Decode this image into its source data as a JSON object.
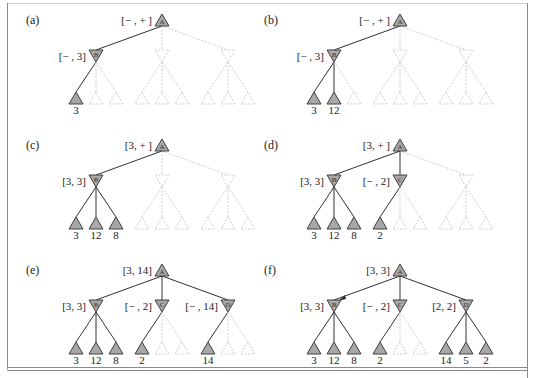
{
  "figure": {
    "colors": {
      "node_fill": "#a8a8a8",
      "node_stroke": "#404040",
      "edge_active": "#303030",
      "edge_pruned": "#c8c8c8",
      "text": "#222222"
    },
    "panels": [
      {
        "label": "(a)",
        "root": {
          "letter": "A",
          "interval": "[− , + ]"
        },
        "mins": [
          {
            "letter": "B",
            "interval": "[− , 3]",
            "active": true,
            "leaves": [
              {
                "value": "3",
                "active": true
              },
              {
                "value": "",
                "active": false
              },
              {
                "value": "",
                "active": false
              }
            ]
          },
          {
            "letter": "",
            "interval": "",
            "active": false,
            "leaves": [
              {
                "value": "",
                "active": false
              },
              {
                "value": "",
                "active": false
              },
              {
                "value": "",
                "active": false
              }
            ]
          },
          {
            "letter": "",
            "interval": "",
            "active": false,
            "leaves": [
              {
                "value": "",
                "active": false
              },
              {
                "value": "",
                "active": false
              },
              {
                "value": "",
                "active": false
              }
            ]
          }
        ]
      },
      {
        "label": "(b)",
        "root": {
          "letter": "A",
          "interval": "[− , + ]"
        },
        "mins": [
          {
            "letter": "B",
            "interval": "[− , 3]",
            "active": true,
            "leaves": [
              {
                "value": "3",
                "active": true
              },
              {
                "value": "12",
                "active": true
              },
              {
                "value": "",
                "active": false
              }
            ]
          },
          {
            "letter": "",
            "interval": "",
            "active": false,
            "leaves": [
              {
                "value": "",
                "active": false
              },
              {
                "value": "",
                "active": false
              },
              {
                "value": "",
                "active": false
              }
            ]
          },
          {
            "letter": "",
            "interval": "",
            "active": false,
            "leaves": [
              {
                "value": "",
                "active": false
              },
              {
                "value": "",
                "active": false
              },
              {
                "value": "",
                "active": false
              }
            ]
          }
        ]
      },
      {
        "label": "(c)",
        "root": {
          "letter": "A",
          "interval": "[3, + ]"
        },
        "mins": [
          {
            "letter": "B",
            "interval": "[3, 3]",
            "active": true,
            "leaves": [
              {
                "value": "3",
                "active": true
              },
              {
                "value": "12",
                "active": true
              },
              {
                "value": "8",
                "active": true
              }
            ]
          },
          {
            "letter": "",
            "interval": "",
            "active": false,
            "leaves": [
              {
                "value": "",
                "active": false
              },
              {
                "value": "",
                "active": false
              },
              {
                "value": "",
                "active": false
              }
            ]
          },
          {
            "letter": "",
            "interval": "",
            "active": false,
            "leaves": [
              {
                "value": "",
                "active": false
              },
              {
                "value": "",
                "active": false
              },
              {
                "value": "",
                "active": false
              }
            ]
          }
        ]
      },
      {
        "label": "(d)",
        "root": {
          "letter": "A",
          "interval": "[3, + ]"
        },
        "mins": [
          {
            "letter": "B",
            "interval": "[3, 3]",
            "active": true,
            "leaves": [
              {
                "value": "3",
                "active": true
              },
              {
                "value": "12",
                "active": true
              },
              {
                "value": "8",
                "active": true
              }
            ]
          },
          {
            "letter": "C",
            "interval": "[− , 2]",
            "active": true,
            "leaves": [
              {
                "value": "2",
                "active": true
              },
              {
                "value": "",
                "active": false
              },
              {
                "value": "",
                "active": false
              }
            ]
          },
          {
            "letter": "",
            "interval": "",
            "active": false,
            "leaves": [
              {
                "value": "",
                "active": false
              },
              {
                "value": "",
                "active": false
              },
              {
                "value": "",
                "active": false
              }
            ]
          }
        ]
      },
      {
        "label": "(e)",
        "root": {
          "letter": "A",
          "interval": "[3, 14]"
        },
        "mins": [
          {
            "letter": "B",
            "interval": "[3, 3]",
            "active": true,
            "leaves": [
              {
                "value": "3",
                "active": true
              },
              {
                "value": "12",
                "active": true
              },
              {
                "value": "8",
                "active": true
              }
            ]
          },
          {
            "letter": "C",
            "interval": "[− , 2]",
            "active": true,
            "leaves": [
              {
                "value": "2",
                "active": true
              },
              {
                "value": "",
                "active": false
              },
              {
                "value": "",
                "active": false
              }
            ]
          },
          {
            "letter": "D",
            "interval": "[− , 14]",
            "active": true,
            "leaves": [
              {
                "value": "14",
                "active": true
              },
              {
                "value": "",
                "active": false
              },
              {
                "value": "",
                "active": false
              }
            ]
          }
        ]
      },
      {
        "label": "(f)",
        "root": {
          "letter": "A",
          "interval": "[3, 3]"
        },
        "best_move_arrow_to": 0,
        "mins": [
          {
            "letter": "B",
            "interval": "[3, 3]",
            "active": true,
            "leaves": [
              {
                "value": "3",
                "active": true
              },
              {
                "value": "12",
                "active": true
              },
              {
                "value": "8",
                "active": true
              }
            ]
          },
          {
            "letter": "C",
            "interval": "[− , 2]",
            "active": true,
            "leaves": [
              {
                "value": "2",
                "active": true
              },
              {
                "value": "",
                "active": false
              },
              {
                "value": "",
                "active": false
              }
            ]
          },
          {
            "letter": "D",
            "interval": "[2, 2]",
            "active": true,
            "leaves": [
              {
                "value": "14",
                "active": true
              },
              {
                "value": "5",
                "active": true
              },
              {
                "value": "2",
                "active": true
              }
            ]
          }
        ]
      }
    ]
  }
}
